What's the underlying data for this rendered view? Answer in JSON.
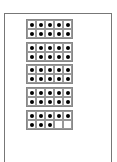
{
  "worksheet": {
    "type": "ten-frames",
    "frames": [
      {
        "filled": 10
      },
      {
        "filled": 10
      },
      {
        "filled": 10
      },
      {
        "filled": 10
      },
      {
        "filled": 8
      }
    ],
    "total_dots": 48,
    "dot_color": "#000000",
    "border_color": "#777777"
  }
}
